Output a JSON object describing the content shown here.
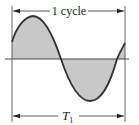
{
  "diagram": {
    "type": "sine-wave-period",
    "top_label": "1 cycle",
    "bottom_label_main": "T",
    "bottom_label_sub": "1",
    "colors": {
      "stroke": "#333333",
      "fill": "#c8c8c8",
      "background": "#ffffff"
    }
  }
}
